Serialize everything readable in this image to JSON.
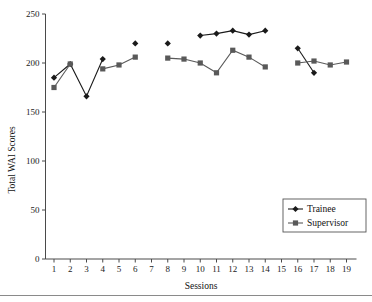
{
  "chart_data": {
    "type": "line",
    "title": "",
    "xlabel": "Sessions",
    "ylabel": "Total WAI Scores",
    "xlim": [
      0.4,
      19.6
    ],
    "ylim": [
      0,
      250
    ],
    "yticks": [
      0,
      50,
      100,
      150,
      200,
      250
    ],
    "xticks": [
      1,
      2,
      3,
      4,
      5,
      6,
      7,
      8,
      9,
      10,
      11,
      12,
      13,
      14,
      15,
      16,
      17,
      18,
      19
    ],
    "grid": false,
    "legend_position": "lower-right",
    "series": [
      {
        "name": "Trainee",
        "marker": "diamond",
        "color": "#1a1a1a",
        "points": [
          {
            "x": 1,
            "y": 185
          },
          {
            "x": 2,
            "y": 199
          },
          {
            "x": 3,
            "y": 166
          },
          {
            "x": 4,
            "y": 204
          },
          {
            "x": 6,
            "y": 220
          },
          {
            "x": 8,
            "y": 220
          },
          {
            "x": 10,
            "y": 228
          },
          {
            "x": 11,
            "y": 230
          },
          {
            "x": 12,
            "y": 233
          },
          {
            "x": 13,
            "y": 229
          },
          {
            "x": 14,
            "y": 233
          },
          {
            "x": 16,
            "y": 215
          },
          {
            "x": 17,
            "y": 190
          }
        ],
        "segments": [
          [
            1,
            2,
            3,
            4
          ],
          [
            6
          ],
          [
            8
          ],
          [
            10,
            11,
            12,
            13,
            14
          ],
          [
            16,
            17
          ]
        ]
      },
      {
        "name": "Supervisor",
        "marker": "square",
        "color": "#595959",
        "points": [
          {
            "x": 1,
            "y": 175
          },
          {
            "x": 2,
            "y": 199
          },
          {
            "x": 4,
            "y": 194
          },
          {
            "x": 5,
            "y": 198
          },
          {
            "x": 6,
            "y": 206
          },
          {
            "x": 8,
            "y": 205
          },
          {
            "x": 9,
            "y": 204
          },
          {
            "x": 10,
            "y": 200
          },
          {
            "x": 11,
            "y": 190
          },
          {
            "x": 12,
            "y": 213
          },
          {
            "x": 13,
            "y": 206
          },
          {
            "x": 14,
            "y": 196
          },
          {
            "x": 16,
            "y": 200
          },
          {
            "x": 17,
            "y": 202
          },
          {
            "x": 18,
            "y": 198
          },
          {
            "x": 19,
            "y": 201
          }
        ],
        "segments": [
          [
            1,
            2
          ],
          [
            4,
            5,
            6
          ],
          [
            8,
            9,
            10,
            11,
            12,
            13,
            14
          ],
          [
            16,
            17,
            18,
            19
          ]
        ]
      }
    ]
  },
  "legend": {
    "entries": [
      {
        "label": "Trainee",
        "marker": "diamond",
        "color": "#1a1a1a"
      },
      {
        "label": "Supervisor",
        "marker": "square",
        "color": "#595959"
      }
    ]
  }
}
